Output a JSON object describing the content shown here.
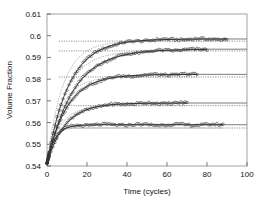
{
  "chart_data": {
    "type": "line",
    "title": "",
    "xlabel": "Time (cycles)",
    "ylabel": "Volume Fraction",
    "xlim": [
      0,
      100
    ],
    "ylim": [
      0.54,
      0.61
    ],
    "xticks": [
      0,
      20,
      40,
      60,
      80,
      100
    ],
    "yticks": [
      0.54,
      0.55,
      0.56,
      0.57,
      0.58,
      0.59,
      0.6,
      0.61
    ],
    "xtick_labels": [
      "0",
      "20",
      "40",
      "60",
      "80",
      "100"
    ],
    "ytick_labels": [
      "0.54",
      "0.55",
      "0.56",
      "0.57",
      "0.58",
      "0.59",
      "0.6",
      "0.61"
    ],
    "grid": false,
    "legend": null,
    "marker": "open-circle",
    "series": [
      {
        "name": "series-1",
        "marker_color": "#333333",
        "fit_color": "#222222",
        "asymptote_solid": 0.5985,
        "asymptote_dashed": 0.5975,
        "v0": 0.5412,
        "tau": 11.0,
        "t_end": 90,
        "noise": 0.00045,
        "x": [
          0,
          1,
          2,
          3,
          4,
          5,
          6,
          8,
          10,
          12,
          14,
          16,
          18,
          20,
          24,
          28,
          32,
          36,
          40,
          44,
          48,
          52,
          56,
          60,
          64,
          68,
          72,
          76,
          80,
          84,
          88,
          90
        ],
        "y": [
          0.5412,
          0.556,
          0.5665,
          0.5735,
          0.5785,
          0.582,
          0.5848,
          0.5884,
          0.5906,
          0.592,
          0.5932,
          0.594,
          0.5946,
          0.5951,
          0.5958,
          0.5963,
          0.5966,
          0.597,
          0.5972,
          0.5974,
          0.5976,
          0.5978,
          0.5979,
          0.598,
          0.5982,
          0.5983,
          0.5984,
          0.5985,
          0.5986,
          0.5987,
          0.5988,
          0.5989
        ]
      },
      {
        "name": "series-2",
        "marker_color": "#333333",
        "fit_color": "#222222",
        "asymptote_solid": 0.5938,
        "asymptote_dashed": 0.593,
        "v0": 0.5412,
        "tau": 13.0,
        "t_end": 80,
        "noise": 0.00045,
        "x": [
          0,
          1,
          2,
          3,
          4,
          5,
          6,
          8,
          10,
          12,
          14,
          16,
          18,
          20,
          24,
          28,
          32,
          36,
          40,
          44,
          48,
          52,
          56,
          60,
          64,
          68,
          72,
          76,
          80
        ],
        "y": [
          0.5412,
          0.5545,
          0.5638,
          0.5702,
          0.5748,
          0.5781,
          0.5806,
          0.584,
          0.5862,
          0.5877,
          0.5887,
          0.5895,
          0.5901,
          0.5906,
          0.5913,
          0.5918,
          0.5922,
          0.5925,
          0.5927,
          0.5929,
          0.5931,
          0.5932,
          0.5933,
          0.5934,
          0.5935,
          0.5936,
          0.5936,
          0.5937,
          0.5938
        ]
      },
      {
        "name": "series-3",
        "marker_color": "#333333",
        "fit_color": "#222222",
        "asymptote_solid": 0.5822,
        "asymptote_dashed": 0.581,
        "v0": 0.5412,
        "tau": 10.0,
        "t_end": 75,
        "noise": 0.00045,
        "x": [
          0,
          1,
          2,
          3,
          4,
          5,
          6,
          8,
          10,
          12,
          14,
          16,
          18,
          20,
          24,
          28,
          32,
          36,
          40,
          44,
          48,
          52,
          56,
          60,
          64,
          68,
          72,
          75
        ],
        "y": [
          0.5412,
          0.5527,
          0.5608,
          0.5665,
          0.5705,
          0.5734,
          0.5755,
          0.5782,
          0.5797,
          0.5805,
          0.581,
          0.5813,
          0.5815,
          0.5816,
          0.5818,
          0.5819,
          0.5819,
          0.582,
          0.582,
          0.5821,
          0.5821,
          0.5821,
          0.5822,
          0.5822,
          0.5822,
          0.5822,
          0.5822,
          0.5822
        ]
      },
      {
        "name": "series-4",
        "marker_color": "#333333",
        "fit_color": "#222222",
        "asymptote_solid": 0.569,
        "asymptote_dashed": 0.5678,
        "v0": 0.5412,
        "tau": 9.0,
        "t_end": 70,
        "noise": 0.00045,
        "x": [
          0,
          1,
          2,
          3,
          4,
          5,
          6,
          8,
          10,
          12,
          14,
          16,
          18,
          20,
          24,
          28,
          32,
          36,
          40,
          44,
          48,
          52,
          56,
          60,
          64,
          68,
          70
        ],
        "y": [
          0.5412,
          0.5512,
          0.558,
          0.5625,
          0.5655,
          0.5674,
          0.5686,
          0.566,
          0.5652,
          0.5655,
          0.5658,
          0.5661,
          0.5663,
          0.5665,
          0.5668,
          0.5671,
          0.5673,
          0.5675,
          0.5677,
          0.5679,
          0.5681,
          0.5683,
          0.5685,
          0.5687,
          0.5688,
          0.5689,
          0.569
        ]
      },
      {
        "name": "series-5",
        "marker_color": "#333333",
        "fit_color": "#222222",
        "asymptote_solid": 0.559,
        "asymptote_dashed": 0.5575,
        "v0": 0.5412,
        "tau": 4.0,
        "t_end": 88,
        "noise": 0.00045,
        "x": [
          0,
          1,
          2,
          3,
          4,
          5,
          6,
          8,
          10,
          12,
          14,
          16,
          18,
          20,
          24,
          28,
          32,
          36,
          40,
          44,
          48,
          52,
          56,
          60,
          64,
          68,
          72,
          76,
          80,
          84,
          88
        ],
        "y": [
          0.5412,
          0.55,
          0.554,
          0.5556,
          0.5562,
          0.5564,
          0.5565,
          0.5566,
          0.5567,
          0.5568,
          0.5569,
          0.557,
          0.557,
          0.5571,
          0.5572,
          0.5573,
          0.5574,
          0.5575,
          0.5576,
          0.5577,
          0.5578,
          0.5579,
          0.558,
          0.5581,
          0.5582,
          0.5583,
          0.5584,
          0.5585,
          0.5586,
          0.5587,
          0.5588
        ]
      }
    ]
  }
}
